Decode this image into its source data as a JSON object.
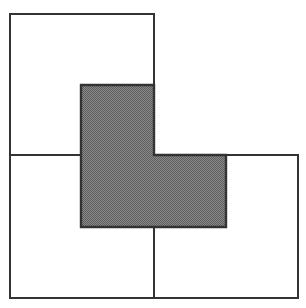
{
  "diagram": {
    "colors": {
      "background": "#ffffff",
      "stroke": "#333333",
      "shade_fill": "#8a8a8a",
      "shade_dot": "#5e5e5e"
    },
    "squares": [
      {
        "name": "top-left-square",
        "x": 10,
        "y": 14,
        "width": 144,
        "height": 141
      },
      {
        "name": "bottom-left-square",
        "x": 10,
        "y": 155,
        "width": 144,
        "height": 143
      },
      {
        "name": "bottom-right-square",
        "x": 154,
        "y": 155,
        "width": 144,
        "height": 143
      }
    ],
    "shaded_region": {
      "name": "shaded-l-region",
      "points": [
        [
          81,
          85
        ],
        [
          154,
          85
        ],
        [
          154,
          155
        ],
        [
          226,
          155
        ],
        [
          226,
          227
        ],
        [
          81,
          227
        ]
      ]
    }
  }
}
